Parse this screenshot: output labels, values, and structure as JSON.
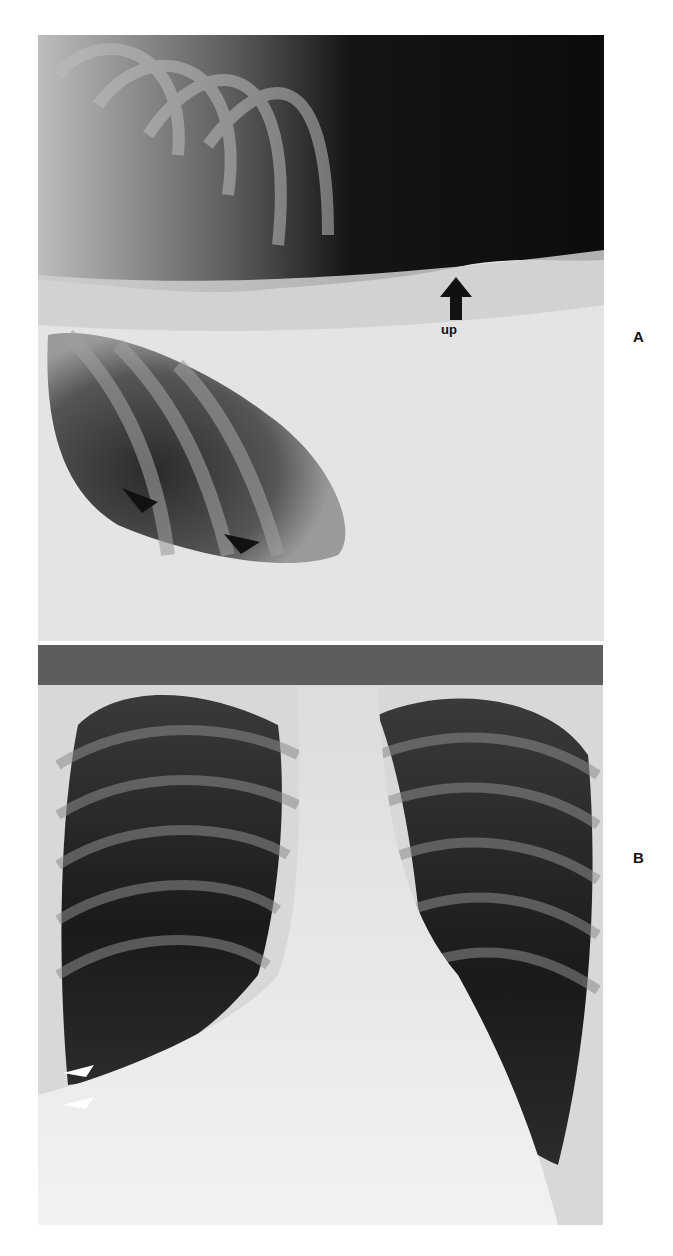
{
  "figure": {
    "panels": [
      {
        "id": "A",
        "label": "A",
        "description": "Lateral decubitus chest radiograph",
        "annotations": [
          {
            "type": "arrow",
            "direction": "up",
            "color": "#111111",
            "text": "up"
          },
          {
            "type": "arrowhead",
            "color": "#111111",
            "count": 2
          }
        ]
      },
      {
        "id": "B",
        "label": "B",
        "description": "Frontal (PA) chest radiograph",
        "annotations": [
          {
            "type": "arrowhead",
            "color": "#ffffff",
            "count": 2
          }
        ]
      }
    ]
  }
}
